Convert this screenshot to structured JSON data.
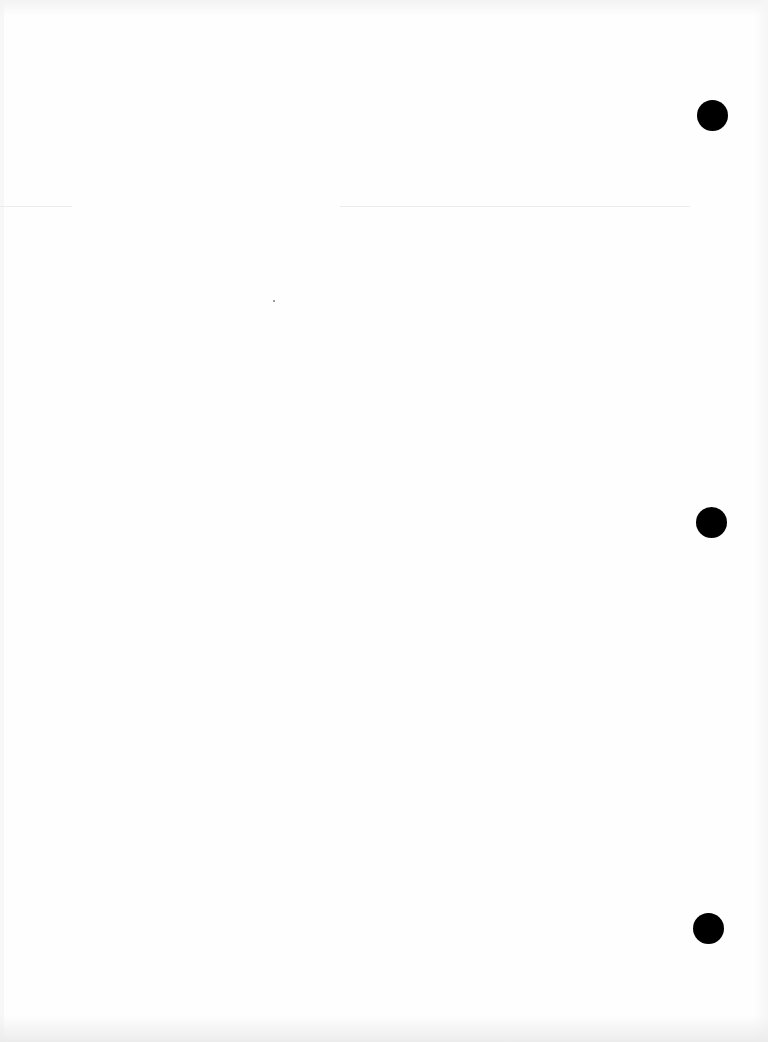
{
  "document": {
    "type": "blank scanned page",
    "text": "",
    "background_color": "#fefefe",
    "punch_holes": [
      {
        "cx": 712,
        "cy": 115,
        "diameter": 31
      },
      {
        "cx": 711,
        "cy": 522,
        "diameter": 31
      },
      {
        "cx": 708,
        "cy": 928,
        "diameter": 31
      }
    ],
    "punch_hole_color": "#000000"
  }
}
